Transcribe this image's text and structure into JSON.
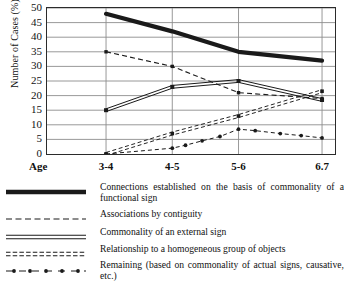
{
  "chart_data": {
    "type": "line",
    "title": "",
    "xlabel": "Age",
    "ylabel": "Number of Cases (%)",
    "categories": [
      "3-4",
      "4-5",
      "5-6",
      "6.7"
    ],
    "x_axis_name": "Age",
    "ylim": [
      0,
      50
    ],
    "ytick_step": 5,
    "yticks": [
      "0",
      "5",
      "10",
      "15",
      "20",
      "25",
      "30",
      "35",
      "40",
      "45",
      "50"
    ],
    "grid": true,
    "legend_position": "below",
    "series": [
      {
        "name": "Connections established on the basis of commonality of a functional sign",
        "style": "thick-solid",
        "values": [
          48,
          42,
          35,
          32
        ]
      },
      {
        "name": "Associations by contiguity",
        "style": "dashed",
        "values": [
          35,
          30,
          21,
          19
        ]
      },
      {
        "name": "Commonality of an external sign",
        "style": "double-solid",
        "values": [
          15,
          23,
          25,
          18.5
        ]
      },
      {
        "name": "Relationship to a homogeneous group of objects",
        "style": "fine-dashed",
        "values": [
          0,
          7,
          13,
          21.5
        ]
      },
      {
        "name": "Remaining (based on commonality of actual signs, causative, etc.)",
        "style": "dot-dash",
        "values": [
          0,
          2,
          8.5,
          5.5
        ],
        "intermediate_points": [
          {
            "x": 1.2,
            "y": 3
          },
          {
            "x": 1.45,
            "y": 4.5
          },
          {
            "x": 1.72,
            "y": 6
          },
          {
            "x": 2.2,
            "y": 8
          },
          {
            "x": 2.5,
            "y": 7
          },
          {
            "x": 2.75,
            "y": 6.3
          }
        ]
      }
    ]
  },
  "legend": {
    "items": [
      {
        "swatch": "thick-solid",
        "label": "Connections established on the basis of common­ality of a functional sign"
      },
      {
        "swatch": "dashed",
        "label": "Associations by contiguity"
      },
      {
        "swatch": "double-solid",
        "label": "Commonality of an external sign"
      },
      {
        "swatch": "fine-dashed",
        "label": "Relationship to a homogeneous group of objects"
      },
      {
        "swatch": "dot-dash",
        "label": "Remaining (based on commonality of actual signs, causative, etc.)"
      }
    ]
  },
  "colors": {
    "ink": "#1a1a1a",
    "grid": "#8d8d8d",
    "axis": "#2b2b2b",
    "background": "#ffffff"
  }
}
